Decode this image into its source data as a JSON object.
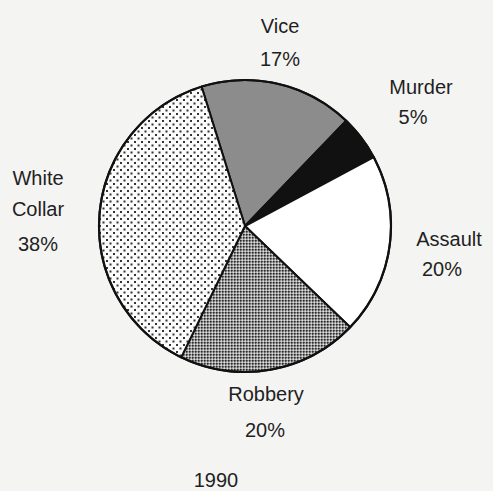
{
  "chart_data": {
    "type": "pie",
    "title": "1990",
    "labels": [
      "Vice",
      "Murder",
      "Assault",
      "Robbery",
      "White Collar"
    ],
    "values": [
      17,
      5,
      20,
      20,
      38
    ],
    "value_labels": [
      "17%",
      "5%",
      "20%",
      "20%",
      "38%"
    ],
    "start_angle_deg": -17.3,
    "direction": "clockwise",
    "fills": [
      "#8c8c8c",
      "#111111",
      "#ffffff",
      "pattern-checker",
      "pattern-dots"
    ],
    "legend": "none (direct labels)"
  },
  "labels": {
    "vice": {
      "name": "Vice",
      "pct": "17%"
    },
    "murder": {
      "name": "Murder",
      "pct": "5%"
    },
    "assault": {
      "name": "Assault",
      "pct": "20%"
    },
    "robbery": {
      "name": "Robbery",
      "pct": "20%"
    },
    "white_collar": {
      "line1": "White",
      "line2": "Collar",
      "pct": "38%"
    }
  },
  "caption": "1990"
}
